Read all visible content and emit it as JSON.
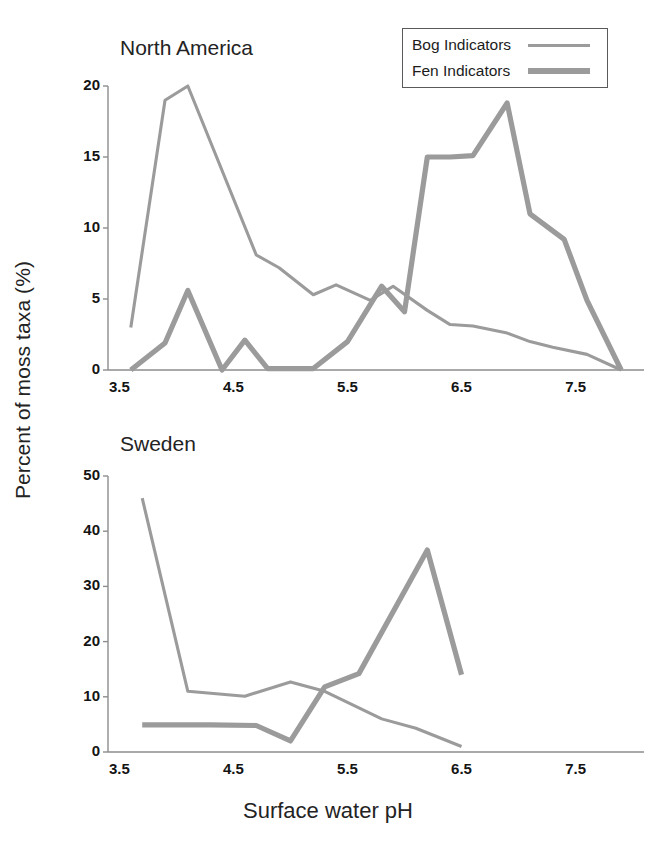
{
  "figure": {
    "xlabel": "Surface water pH",
    "ylabel": "Percent of moss taxa (%)"
  },
  "legend": {
    "position": "top-right",
    "entries": [
      {
        "label": "Bog Indicators",
        "color": "#9b9b9b",
        "width": 3
      },
      {
        "label": "Fen Indicators",
        "color": "#9b9b9b",
        "width": 6
      }
    ]
  },
  "chart_data": [
    {
      "type": "line",
      "title": "North America",
      "xlabel": "Surface water pH",
      "ylabel": "Percent of moss taxa (%)",
      "xlim": [
        3.4,
        8.1
      ],
      "ylim": [
        0,
        20
      ],
      "xticks": [
        "3.5",
        "4.5",
        "5.5",
        "6.5",
        "7.5"
      ],
      "xtick_values": [
        3.5,
        4.5,
        5.5,
        6.5,
        7.5
      ],
      "yticks": [
        "0",
        "5",
        "10",
        "15",
        "20"
      ],
      "ytick_values": [
        0,
        5,
        10,
        15,
        20
      ],
      "grid": false,
      "series": [
        {
          "name": "Bog Indicators",
          "color": "#9b9b9b",
          "x": [
            3.6,
            3.9,
            4.1,
            4.7,
            4.9,
            5.2,
            5.4,
            5.7,
            5.9,
            6.2,
            6.4,
            6.6,
            6.9,
            7.1,
            7.3,
            7.6,
            7.9
          ],
          "y": [
            3.0,
            19.0,
            20.0,
            8.1,
            7.2,
            5.3,
            6.0,
            4.9,
            5.9,
            4.2,
            3.2,
            3.1,
            2.6,
            2.0,
            1.6,
            1.1,
            0.0
          ]
        },
        {
          "name": "Fen Indicators",
          "color": "#9b9b9b",
          "x": [
            3.6,
            3.9,
            4.1,
            4.4,
            4.6,
            4.8,
            5.2,
            5.5,
            5.8,
            6.0,
            6.2,
            6.4,
            6.6,
            6.9,
            7.1,
            7.4,
            7.6,
            7.9
          ],
          "y": [
            0.0,
            1.9,
            5.6,
            0.0,
            2.1,
            0.1,
            0.1,
            2.0,
            5.9,
            4.1,
            15.0,
            15.0,
            15.1,
            18.8,
            11.0,
            9.2,
            4.9,
            0.0
          ]
        }
      ]
    },
    {
      "type": "line",
      "title": "Sweden",
      "xlabel": "Surface water pH",
      "ylabel": "Percent of moss taxa (%)",
      "xlim": [
        3.4,
        8.1
      ],
      "ylim": [
        0,
        50
      ],
      "xticks": [
        "3.5",
        "4.5",
        "5.5",
        "6.5",
        "7.5"
      ],
      "xtick_values": [
        3.5,
        4.5,
        5.5,
        6.5,
        7.5
      ],
      "yticks": [
        "0",
        "10",
        "20",
        "30",
        "40",
        "50"
      ],
      "ytick_values": [
        0,
        10,
        20,
        30,
        40,
        50
      ],
      "grid": false,
      "series": [
        {
          "name": "Bog Indicators",
          "color": "#9b9b9b",
          "x": [
            3.7,
            4.1,
            4.6,
            5.0,
            5.3,
            5.8,
            6.1,
            6.5
          ],
          "y": [
            46.0,
            11.0,
            10.1,
            12.7,
            11.0,
            6.0,
            4.3,
            1.0
          ]
        },
        {
          "name": "Fen Indicators",
          "color": "#9b9b9b",
          "x": [
            3.7,
            4.3,
            4.7,
            5.0,
            5.3,
            5.6,
            6.2,
            6.5
          ],
          "y": [
            4.9,
            4.9,
            4.8,
            2.0,
            11.8,
            14.2,
            36.6,
            14.0
          ]
        }
      ]
    }
  ]
}
